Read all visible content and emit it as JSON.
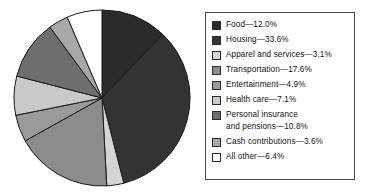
{
  "chart_data": {
    "type": "pie",
    "title": "",
    "subtitle": "",
    "xlabel": "",
    "ylabel": "",
    "legend_position": "right",
    "grid": false,
    "start_angle_deg": 0,
    "direction": "clockwise",
    "categories": [
      "Food",
      "Housing",
      "Apparel and services",
      "Transportation",
      "Entertainment",
      "Health care",
      "Personal insurance and pensions",
      "Cash contributions",
      "All other"
    ],
    "values": [
      12.0,
      33.6,
      3.1,
      17.6,
      4.9,
      7.1,
      10.8,
      3.6,
      6.4
    ],
    "unit": "%",
    "colors": [
      "#2b2b2b",
      "#333333",
      "#d4d4d4",
      "#8c8c8c",
      "#9a9a9a",
      "#c9c9c9",
      "#6e6e6e",
      "#a8a8a8",
      "#ffffff"
    ],
    "slice_outline": "#1a1a1a"
  },
  "legend": {
    "items": [
      {
        "label": "Food—12.0%",
        "swatch": "#2b2b2b",
        "name": "food"
      },
      {
        "label": "Housing—33.6%",
        "swatch": "#333333",
        "name": "housing"
      },
      {
        "label": "Apparel and services—3.1%",
        "swatch": "#d4d4d4",
        "name": "apparel-and-services"
      },
      {
        "label": "Transportation—17.6%",
        "swatch": "#8c8c8c",
        "name": "transportation"
      },
      {
        "label": "Entertainment—4.9%",
        "swatch": "#9a9a9a",
        "name": "entertainment"
      },
      {
        "label": "Health care—7.1%",
        "swatch": "#c9c9c9",
        "name": "health-care"
      },
      {
        "label": "Personal insurance\nand pensions—10.8%",
        "swatch": "#6e6e6e",
        "name": "personal-insurance-and-pensions"
      },
      {
        "label": "Cash contributions—3.6%",
        "swatch": "#a8a8a8",
        "name": "cash-contributions"
      },
      {
        "label": "All other—6.4%",
        "swatch": "#ffffff",
        "name": "all-other"
      }
    ]
  }
}
